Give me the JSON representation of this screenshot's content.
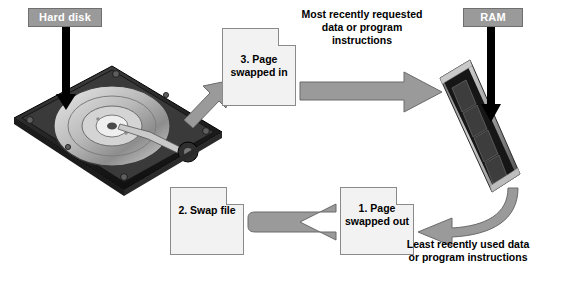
{
  "diagram": {
    "labels": {
      "hard_disk": "Hard disk",
      "ram": "RAM"
    },
    "documents": [
      {
        "id": "page-swapped-in",
        "text": "3. Page\nswapped\nin"
      },
      {
        "id": "swap-file",
        "text": "2. Swap\nfile"
      },
      {
        "id": "page-swapped-out",
        "text": "1. Page\nswapped\nout"
      }
    ],
    "doc_page_swapped_in_text": "3. Page swapped in",
    "doc_swap_file_text": "2. Swap file",
    "doc_page_swapped_out_text": "1. Page swapped out",
    "annotations": {
      "most_recent": "Most recently requested data or program instructions",
      "least_recent": "Least recently used data or program instructions"
    },
    "colors": {
      "label_box_fill": "#9a9a9a",
      "label_box_text": "#ffffff",
      "document_fill": "#f2f2f2",
      "arrow_fill": "#9a9a9a",
      "pointer_arrow": "#000000"
    }
  }
}
